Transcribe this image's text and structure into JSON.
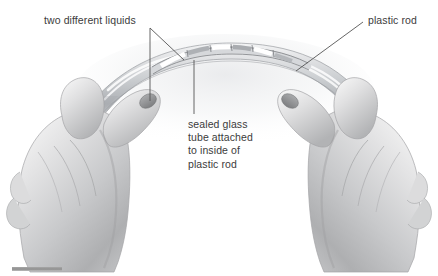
{
  "figure": {
    "background_color": "#ffffff",
    "ink_color": "#3b3b3b",
    "line_color": "#555555"
  },
  "labels": {
    "liquids": "two different liquids",
    "rod": "plastic rod",
    "tube": "sealed glass\ntube attached\nto inside of\nplastic rod"
  },
  "callouts": [
    {
      "name": "two-different-liquids",
      "text": "two different liquids",
      "text_x": 44,
      "text_y": 14,
      "leaders": [
        {
          "x1": 150,
          "y1": 28,
          "x2": 150,
          "y2": 101
        },
        {
          "x1": 150,
          "y1": 28,
          "x2": 184,
          "y2": 60
        }
      ]
    },
    {
      "name": "plastic-rod",
      "text": "plastic rod",
      "text_x": 368,
      "text_y": 14,
      "leaders": [
        {
          "x1": 363,
          "y1": 22,
          "x2": 296,
          "y2": 71
        }
      ]
    },
    {
      "name": "sealed-glass-tube",
      "text": "sealed glass tube attached to inside of plastic rod",
      "text_x": 188,
      "text_y": 118,
      "leaders": [
        {
          "x1": 194,
          "y1": 60,
          "x2": 194,
          "y2": 114
        }
      ]
    }
  ],
  "rod": {
    "name": "plastic-rod",
    "shape": "arc",
    "fill_light": "#e6e7e9",
    "fill_mid": "#c6c8cb",
    "fill_dark": "#9a9da1",
    "highlight": "#f2f3f4",
    "thickness_px": 16
  },
  "glass_tube": {
    "name": "sealed-glass-tube",
    "outline_color": "#6f7276",
    "glass_fill": "#d9dbde",
    "liquid_segments": 7,
    "liquid_a_color": "#ffffff",
    "liquid_b_color": "#aeb1b5"
  },
  "hands": {
    "left": {
      "name": "left-hand",
      "skin_light": "#efeff0",
      "skin_mid": "#c9cacb",
      "skin_dark": "#9b9c9e"
    },
    "right": {
      "name": "right-hand",
      "skin_light": "#efeff0",
      "skin_mid": "#c9cacb",
      "skin_dark": "#9b9c9e"
    }
  },
  "footer_rule": {
    "name": "footer-rule",
    "x": 12,
    "y": 267,
    "width": 50,
    "height": 4,
    "color": "#9a9a9a"
  }
}
